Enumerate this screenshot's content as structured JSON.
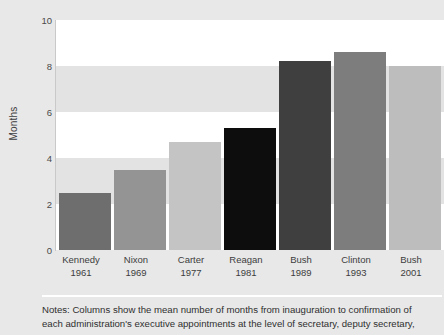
{
  "chart_data": {
    "type": "bar",
    "title": "",
    "subtitle": "",
    "xlabel": "",
    "ylabel": "Months",
    "ylim": [
      0,
      10
    ],
    "yticks": [
      0,
      2,
      4,
      6,
      8,
      10
    ],
    "ytick_labels": [
      "0",
      "2",
      "4",
      "6",
      "8",
      "10"
    ],
    "grid": "alternating-horizontal-bands",
    "legend": "none",
    "categories": [
      "Kennedy 1961",
      "Nixon 1969",
      "Carter 1977",
      "Reagan 1981",
      "Bush 1989",
      "Clinton 1993",
      "Bush 2001"
    ],
    "values": [
      2.5,
      3.5,
      4.7,
      5.3,
      8.2,
      8.6,
      8.0
    ],
    "bars": [
      {
        "name": "Kennedy",
        "year": "1961",
        "value": 2.5,
        "color": "#6e6e6e"
      },
      {
        "name": "Nixon",
        "year": "1969",
        "value": 3.5,
        "color": "#949494"
      },
      {
        "name": "Carter",
        "year": "1977",
        "value": 4.7,
        "color": "#c4c4c4"
      },
      {
        "name": "Reagan",
        "year": "1981",
        "value": 5.3,
        "color": "#0d0d0d"
      },
      {
        "name": "Bush",
        "year": "1989",
        "value": 8.2,
        "color": "#3f3f3f"
      },
      {
        "name": "Clinton",
        "year": "1993",
        "value": 8.6,
        "color": "#7d7d7d"
      },
      {
        "name": "Bush",
        "year": "2001",
        "value": 8.0,
        "color": "#bdbdbd"
      }
    ]
  },
  "axis": {
    "y_title": "Months",
    "ticks": [
      "10",
      "8",
      "6",
      "4",
      "2",
      "0"
    ]
  },
  "xaxis": {
    "items": [
      {
        "name": "Kennedy",
        "year": "1961"
      },
      {
        "name": "Nixon",
        "year": "1969"
      },
      {
        "name": "Carter",
        "year": "1977"
      },
      {
        "name": "Reagan",
        "year": "1981"
      },
      {
        "name": "Bush",
        "year": "1989"
      },
      {
        "name": "Clinton",
        "year": "1993"
      },
      {
        "name": "Bush",
        "year": "2001"
      }
    ]
  },
  "footer": {
    "notes_line1": "Notes: Columns show the mean number of months from inauguration to confirmation of",
    "notes_line2": "each administration's executive appointments at the level of secretary, deputy secretary,"
  },
  "colors": {
    "page_background": "#e8e8e8",
    "band_light": "#ffffff",
    "band_shade": "#e3e3e3",
    "axis_line": "#c9c9c9",
    "text": "#3d3d3d",
    "rule": "#ffffff"
  }
}
